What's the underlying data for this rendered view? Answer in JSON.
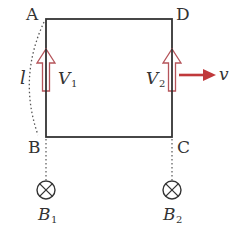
{
  "diagram": {
    "type": "physics-circuit",
    "vertices": {
      "A": "A",
      "B": "B",
      "C": "C",
      "D": "D"
    },
    "length_label": "l",
    "voltmeters": [
      {
        "label": "V",
        "subscript": "1"
      },
      {
        "label": "V",
        "subscript": "2"
      }
    ],
    "velocity_label": "v",
    "fields": [
      {
        "label": "B",
        "subscript": "1",
        "direction": "into-page"
      },
      {
        "label": "B",
        "subscript": "2",
        "direction": "into-page"
      }
    ],
    "colors": {
      "line": "#333333",
      "arrow": "#c0393b",
      "arrow_outline": "#b5545a"
    }
  }
}
